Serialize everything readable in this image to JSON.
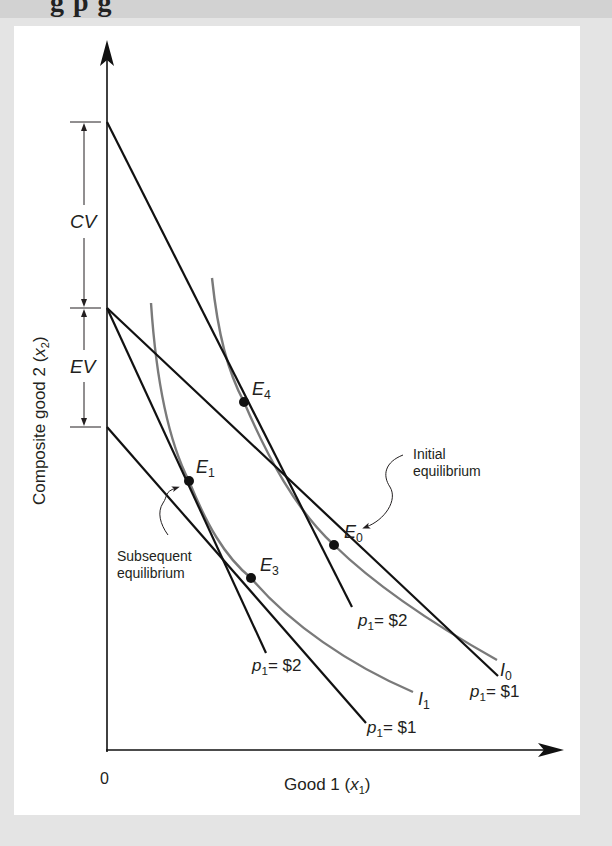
{
  "header": {
    "cropped_title_fragment": "g        p        g"
  },
  "diagram": {
    "axes": {
      "origin_label": "0",
      "x_label": "Good 1 (",
      "x_var": "x",
      "x_sub": "1",
      "x_close": ")",
      "y_label": "Composite good 2 (",
      "y_var": "x",
      "y_sub": "2",
      "y_close": ")"
    },
    "brackets": {
      "cv": "CV",
      "ev": "EV"
    },
    "points": {
      "e0": {
        "letter": "E",
        "sub": "0"
      },
      "e1": {
        "letter": "E",
        "sub": "1"
      },
      "e3": {
        "letter": "E",
        "sub": "3"
      },
      "e4": {
        "letter": "E",
        "sub": "4"
      }
    },
    "curves": {
      "i0": {
        "letter": "I",
        "sub": "0"
      },
      "i1": {
        "letter": "I",
        "sub": "1"
      }
    },
    "budget_labels": {
      "steep_inner": {
        "p": "p",
        "sub": "1",
        "value": "= $2"
      },
      "steep_outer": {
        "p": "p",
        "sub": "1",
        "value": "= $2"
      },
      "shallow_inner": {
        "p": "p",
        "sub": "1",
        "value": "= $1"
      },
      "shallow_outer": {
        "p": "p",
        "sub": "1",
        "value": "= $1"
      }
    },
    "annotations": {
      "initial_line1": "Initial",
      "initial_line2": "equilibrium",
      "subsequent_line1": "Subsequent",
      "subsequent_line2": "equilibrium"
    },
    "colors": {
      "budget_line": "#111111",
      "indifference_curve": "#7a7a7a",
      "axis": "#111111",
      "panel_bg": "#ffffff",
      "page_bg": "#e4e4e4"
    }
  }
}
